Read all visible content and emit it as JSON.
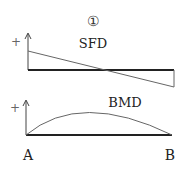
{
  "figure_number": "①",
  "sfd": {
    "title": "SFD",
    "sign": "+"
  },
  "bmd": {
    "title": "BMD",
    "sign": "+"
  },
  "supports": {
    "left": "A",
    "right": "B"
  },
  "colors": {
    "axis": "#222222",
    "curve": "#555555"
  }
}
